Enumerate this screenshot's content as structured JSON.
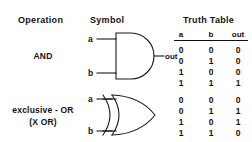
{
  "headers": {
    "operation": "Operation",
    "symbol": "Symbol",
    "truth_table": "Truth Table"
  },
  "truth_table_columns": {
    "a": "a",
    "b": "b",
    "out": "out"
  },
  "colors": {
    "ink": "#1a1a1a",
    "background": "#ffffff"
  },
  "rows": [
    {
      "operation": "AND",
      "operation_line2": "",
      "gate": "and-gate",
      "inputs": {
        "a": "a",
        "b": "b"
      },
      "output": "out",
      "truth_table": [
        {
          "a": "0",
          "b": "0",
          "out": "0"
        },
        {
          "a": "0",
          "b": "1",
          "out": "0"
        },
        {
          "a": "1",
          "b": "0",
          "out": "0"
        },
        {
          "a": "1",
          "b": "1",
          "out": "1"
        }
      ]
    },
    {
      "operation": "exclusive - OR",
      "operation_line2": "(X OR)",
      "gate": "xor-gate",
      "inputs": {
        "a": "a",
        "b": "b"
      },
      "output": "",
      "truth_table": [
        {
          "a": "0",
          "b": "0",
          "out": "0"
        },
        {
          "a": "0",
          "b": "1",
          "out": "1"
        },
        {
          "a": "1",
          "b": "0",
          "out": "1"
        },
        {
          "a": "1",
          "b": "1",
          "out": "0"
        }
      ]
    }
  ]
}
